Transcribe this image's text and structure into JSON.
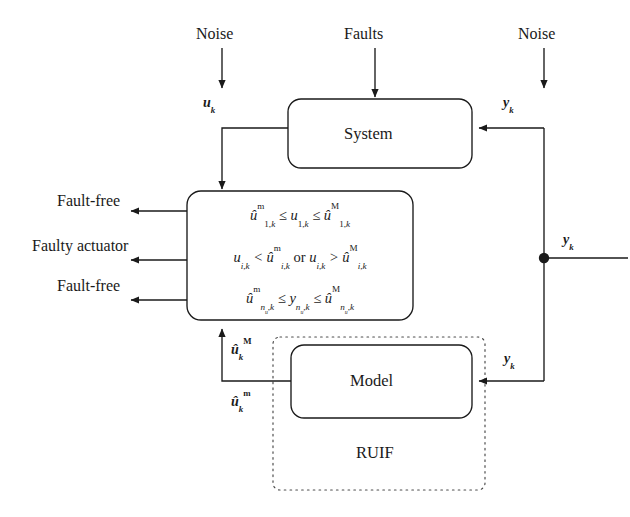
{
  "diagram": {
    "type": "block-diagram",
    "inputs": {
      "noise_left": "Noise",
      "faults": "Faults",
      "noise_right": "Noise"
    },
    "blocks": {
      "system": "System",
      "model": "Model",
      "ruif": "RUIF"
    },
    "signals": {
      "u_k": "u_k",
      "y_k_top": "y_k",
      "y_k_mid": "y_k",
      "y_k_bottom": "y_k",
      "u_hat_M_k": "û_k^M",
      "u_hat_m_k": "û_k^m"
    },
    "decision_labels": [
      "Fault-free",
      "Faulty actuator",
      "Fault-free"
    ],
    "conditions": [
      {
        "id": "cond-1",
        "text": "û^m_{1,k} ≤ u_{1,k} ≤ û^M_{1,k}",
        "outcome": "Fault-free"
      },
      {
        "id": "cond-2",
        "text": "u_{i,k} < û^m_{i,k} or u_{i,k} > û^M_{i,k}",
        "outcome": "Faulty actuator"
      },
      {
        "id": "cond-3",
        "text": "û^m_{n_u,k} ≤ y_{n_u,k} ≤ û^M_{n_u,k}",
        "outcome": "Fault-free"
      }
    ],
    "operators": {
      "leq": "≤",
      "lt": "<",
      "gt": ">",
      "or": "or"
    },
    "colors": {
      "stroke": "#1a1a1a",
      "background": "#ffffff",
      "dashed_stroke": "#4d4d4d"
    }
  }
}
